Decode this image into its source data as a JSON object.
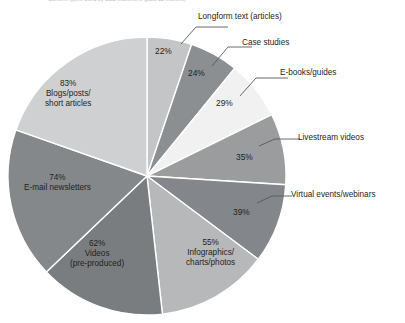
{
  "chart_data": {
    "type": "pie",
    "title": "Content types used by B2B marketers (past 12 months)",
    "xlabel": "",
    "ylabel": "",
    "legend_position": "callout-labels",
    "grid": false,
    "value_suffix": "%",
    "total": 423,
    "start_angle_deg": 0,
    "direction": "clockwise",
    "categories": [
      "Longform text (articles)",
      "Case studies",
      "E-books/guides",
      "Livestream videos",
      "Virtual events/webinars",
      "Infographics/charts/photos",
      "Videos (pre-produced)",
      "E-mail newsletters",
      "Blogs/posts/short articles"
    ],
    "values": [
      22,
      24,
      29,
      35,
      39,
      55,
      62,
      74,
      83
    ],
    "slices": [
      {
        "label": "Longform text (articles)",
        "value": 22,
        "display": "22%",
        "color": "#c3c5c6",
        "label_mode": "callout",
        "pct_x": 155,
        "pct_y": 47,
        "line_x1": 181,
        "line_y1": 44,
        "line_x2": 196,
        "line_y2": 27,
        "line_x3": 228,
        "line_y3": 27,
        "text_x": 198,
        "text_y": 12
      },
      {
        "label": "Case studies",
        "value": 24,
        "display": "24%",
        "color": "#8c8f91",
        "label_mode": "callout",
        "pct_x": 188,
        "pct_y": 69,
        "line_x1": 212,
        "line_y1": 66,
        "line_x2": 228,
        "line_y2": 47,
        "line_x3": 252,
        "line_y3": 47,
        "text_x": 242,
        "text_y": 38
      },
      {
        "label": "E-books/guides",
        "value": 29,
        "display": "29%",
        "color": "#f1f1f1",
        "label_mode": "callout",
        "pct_x": 216,
        "pct_y": 99,
        "line_x1": 240,
        "line_y1": 96,
        "line_x2": 256,
        "line_y2": 78,
        "line_x3": 288,
        "line_y3": 78,
        "text_x": 280,
        "text_y": 68
      },
      {
        "label": "Livestream videos",
        "value": 35,
        "display": "35%",
        "color": "#9a9c9e",
        "label_mode": "callout",
        "pct_x": 236,
        "pct_y": 153,
        "line_x1": 259,
        "line_y1": 146,
        "line_x2": 275,
        "line_y2": 139,
        "line_x3": 300,
        "line_y3": 139,
        "text_x": 298,
        "text_y": 133
      },
      {
        "label": "Virtual events/webinars",
        "value": 39,
        "display": "39%",
        "color": "#83868a",
        "label_mode": "callout",
        "pct_x": 233,
        "pct_y": 208,
        "line_x1": 257,
        "line_y1": 203,
        "line_x2": 272,
        "line_y2": 196,
        "line_x3": 292,
        "line_y3": 196,
        "text_x": 291,
        "text_y": 190
      },
      {
        "label": "Infographics/\ncharts/photos",
        "value": 55,
        "display": "55%",
        "color": "#b6b8ba",
        "label_mode": "inside",
        "text_x": 186,
        "text_y": 238
      },
      {
        "label": "Videos\n(pre-produced)",
        "value": 62,
        "display": "62%",
        "color": "#797d80",
        "label_mode": "inside",
        "text_x": 70,
        "text_y": 239
      },
      {
        "label": "E-mail newsletters",
        "value": 74,
        "display": "74%",
        "color": "#85888b",
        "label_mode": "inside",
        "text_x": 24,
        "text_y": 173
      },
      {
        "label": "Blogs/posts/\nshort articles",
        "value": 83,
        "display": "83%",
        "color": "#cfd0d1",
        "label_mode": "inside",
        "text_x": 45,
        "text_y": 79
      }
    ]
  },
  "callout_labels": [
    {
      "text": "Longform text (articles)"
    },
    {
      "text": "Case studies"
    },
    {
      "text": "E-books/guides"
    },
    {
      "text": "Livestream videos"
    },
    {
      "text": "Virtual events/webinars"
    }
  ],
  "inside_labels": [
    {
      "pct": "55%",
      "l1": "Infographics/",
      "l2": "charts/photos"
    },
    {
      "pct": "62%",
      "l1": "Videos",
      "l2": "(pre-produced)"
    },
    {
      "pct": "74%",
      "l1": "E-mail newsletters",
      "l2": ""
    },
    {
      "pct": "83%",
      "l1": "Blogs/posts/",
      "l2": "short articles"
    }
  ],
  "callout_pcts": [
    "22%",
    "24%",
    "29%",
    "35%",
    "39%"
  ],
  "geometry": {
    "cx": 147,
    "cy": 176,
    "r": 139
  },
  "colors": {
    "background": "#ffffff",
    "text": "#231f20",
    "leader_line": "#58595b",
    "title": "#b9b9bd"
  }
}
